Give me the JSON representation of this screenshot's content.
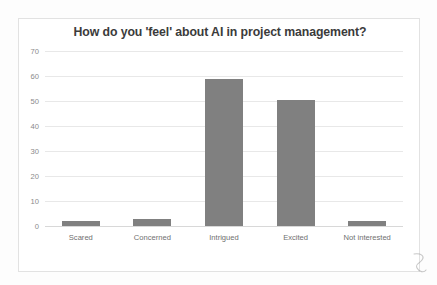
{
  "chart_data": {
    "type": "bar",
    "title": "How do you 'feel' about AI in project management?",
    "categories": [
      "Scared",
      "Concerned",
      "Intrigued",
      "Excited",
      "Not interested"
    ],
    "values": [
      2,
      3,
      59,
      50.5,
      2
    ],
    "xlabel": "",
    "ylabel": "",
    "ylim": [
      0,
      70
    ],
    "yticks": [
      0,
      10,
      20,
      30,
      40,
      50,
      60,
      70
    ],
    "ytick_labels": [
      "0",
      "10",
      "20",
      "30",
      "40",
      "50",
      "60",
      "70"
    ],
    "grid": true,
    "legend": false,
    "series": [
      {
        "name": "Responses",
        "values": [
          2,
          3,
          59,
          50.5,
          2
        ]
      }
    ],
    "colors": {
      "bar_fill": "#808080",
      "gridline": "#e8e8e8",
      "baseline": "#d8d8d8",
      "title_text": "#3b3b3b",
      "tick_text": "#8a8a8a",
      "label_text": "#6f6f6f",
      "card_border": "#e2e2e2",
      "background": "#ffffff"
    }
  },
  "artifacts": {
    "pen_mark": "handwritten-squiggle"
  }
}
